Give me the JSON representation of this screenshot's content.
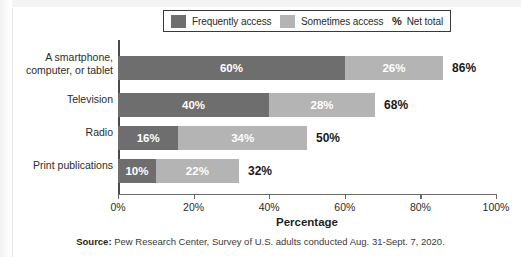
{
  "legend": {
    "items": [
      {
        "label": "Frequently access",
        "color": "#6e6e6e",
        "key": "frequently"
      },
      {
        "label": "Sometimes access",
        "color": "#b4b4b4",
        "key": "sometimes"
      }
    ],
    "net_symbol": "%",
    "net_label": "Net total"
  },
  "source": {
    "prefix": "Source:",
    "text": " Pew Research Center, Survey of U.S. adults conducted Aug. 31-Sept. 7, 2020."
  },
  "chart_data": {
    "type": "bar",
    "orientation": "horizontal",
    "stacked": true,
    "title": "",
    "xlabel": "Percentage",
    "ylabel": "",
    "xlim": [
      0,
      100
    ],
    "xticks": [
      "0%",
      "20%",
      "40%",
      "60%",
      "80%",
      "100%"
    ],
    "xtick_values": [
      0,
      20,
      40,
      60,
      80,
      100
    ],
    "grid": false,
    "legend_position": "top",
    "categories": [
      "A smartphone, computer, or tablet",
      "Television",
      "Radio",
      "Print publications"
    ],
    "series": [
      {
        "name": "Frequently access",
        "color": "#6e6e6e",
        "values": [
          60,
          40,
          16,
          10
        ],
        "labels": [
          "60%",
          "40%",
          "16%",
          "10%"
        ]
      },
      {
        "name": "Sometimes access",
        "color": "#b4b4b4",
        "values": [
          26,
          28,
          34,
          22
        ],
        "labels": [
          "26%",
          "28%",
          "34%",
          "22%"
        ]
      }
    ],
    "net_totals": [
      86,
      68,
      50,
      32
    ],
    "net_total_labels": [
      "86%",
      "68%",
      "50%",
      "32%"
    ]
  },
  "category_label_lines": [
    [
      "A smartphone,",
      "computer, or tablet"
    ],
    [
      "Television"
    ],
    [
      "Radio"
    ],
    [
      "Print publications"
    ]
  ]
}
